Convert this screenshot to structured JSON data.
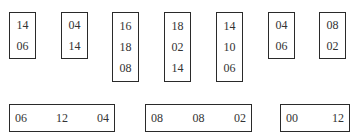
{
  "vertical_boxes": [
    {
      "values": [
        "14",
        "06"
      ]
    },
    {
      "values": [
        "04",
        "14"
      ]
    },
    {
      "values": [
        "16",
        "18",
        "08"
      ]
    },
    {
      "values": [
        "18",
        "02",
        "14"
      ]
    },
    {
      "values": [
        "14",
        "10",
        "06"
      ]
    },
    {
      "values": [
        "04",
        "06"
      ]
    },
    {
      "values": [
        "08",
        "02"
      ]
    }
  ],
  "horizontal_boxes": [
    {
      "values": [
        "06",
        "12",
        "04"
      ]
    },
    {
      "values": [
        "08",
        "08",
        "02"
      ]
    },
    {
      "values": [
        "00",
        "12"
      ]
    }
  ]
}
